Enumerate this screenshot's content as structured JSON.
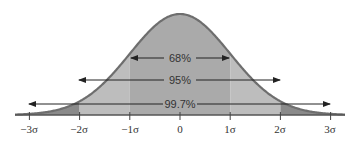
{
  "chart_data": {
    "type": "area",
    "title": "",
    "xlabel": "",
    "ylabel": "",
    "distribution": "normal",
    "x_ticks": [
      "−3σ",
      "−2σ",
      "−1σ",
      "0",
      "1σ",
      "2σ",
      "3σ"
    ],
    "x_tick_values": [
      -3,
      -2,
      -1,
      0,
      1,
      2,
      3
    ],
    "xlim": [
      -3.3,
      3.3
    ],
    "grid": false,
    "regions": [
      {
        "name": "within 1σ",
        "from": -1,
        "to": 1,
        "label": "68%",
        "percent": 68
      },
      {
        "name": "within 2σ",
        "from": -2,
        "to": 2,
        "label": "95%",
        "percent": 95
      },
      {
        "name": "within 3σ",
        "from": -3,
        "to": 3,
        "label": "99.7%",
        "percent": 99.7
      }
    ],
    "annotations": [
      "68%",
      "95%",
      "99.7%"
    ],
    "colors": {
      "curve": "#6e6e6e",
      "inner_fill": "#aaaaaa",
      "middle_fill": "#bdbdbd",
      "tail_fill": "#8a8a8a",
      "axis": "#444444",
      "arrow": "#222222"
    }
  },
  "labels": {
    "r68": "68%",
    "r95": "95%",
    "r997": "99.7%",
    "t_m3": "−3σ",
    "t_m2": "−2σ",
    "t_m1": "−1σ",
    "t_0": "0",
    "t_p1": "1σ",
    "t_p2": "2σ",
    "t_p3": "3σ"
  }
}
